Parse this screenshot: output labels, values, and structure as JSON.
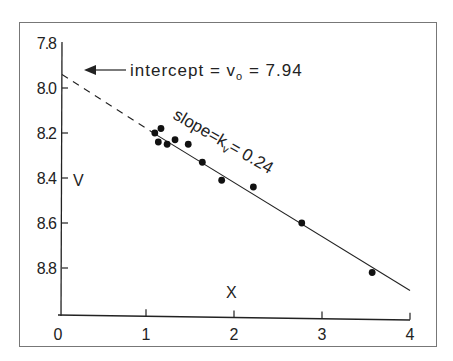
{
  "chart_data": {
    "type": "scatter",
    "title": "",
    "xlabel": "X",
    "ylabel": "V",
    "xlim": [
      0,
      4
    ],
    "ylim": [
      7.8,
      9.0
    ],
    "y_inverted": true,
    "grid": false,
    "x_ticks": [
      "0",
      "1",
      "2",
      "3",
      "4"
    ],
    "y_ticks": [
      "7.8",
      "8.0",
      "8.2",
      "8.4",
      "8.6",
      "8.8"
    ],
    "points": [
      {
        "x": 1.1,
        "y": 8.2
      },
      {
        "x": 1.17,
        "y": 8.18
      },
      {
        "x": 1.14,
        "y": 8.24
      },
      {
        "x": 1.24,
        "y": 8.25
      },
      {
        "x": 1.33,
        "y": 8.23
      },
      {
        "x": 1.48,
        "y": 8.25
      },
      {
        "x": 1.64,
        "y": 8.33
      },
      {
        "x": 1.86,
        "y": 8.41
      },
      {
        "x": 2.22,
        "y": 8.44
      },
      {
        "x": 2.77,
        "y": 8.6
      },
      {
        "x": 3.57,
        "y": 8.82
      }
    ],
    "fit_line": {
      "intercept": 7.94,
      "slope": 0.24,
      "solid_from_x": 1.1,
      "x_end": 4,
      "dashed_from_x": 0
    },
    "annotations": {
      "intercept": {
        "prefix": "intercept = v",
        "subscript": "o",
        "suffix": " = 7.94"
      },
      "slope": {
        "prefix": "slope=k",
        "subscript": "v",
        "suffix": "= 0.24"
      }
    }
  }
}
